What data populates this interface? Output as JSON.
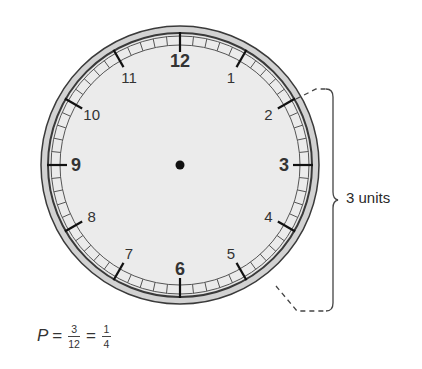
{
  "clock": {
    "numbers": [
      "12",
      "1",
      "2",
      "3",
      "4",
      "5",
      "6",
      "7",
      "8",
      "9",
      "10",
      "11"
    ],
    "bold_numbers": [
      "12",
      "3",
      "6",
      "9"
    ],
    "colors": {
      "face": "#ebebeb",
      "rim_outer": "#d2d2d2",
      "rim_line": "#3a3a3a",
      "tick": "#111111",
      "number": "#333333",
      "center_dot": "#111111"
    }
  },
  "bracket": {
    "label": "3 units",
    "from_number": "2",
    "to_number": "5"
  },
  "formula": {
    "variable": "P",
    "equals": "=",
    "fraction1": {
      "numerator": "3",
      "denominator": "12"
    },
    "equals2": "=",
    "fraction2": {
      "numerator": "1",
      "denominator": "4"
    }
  }
}
